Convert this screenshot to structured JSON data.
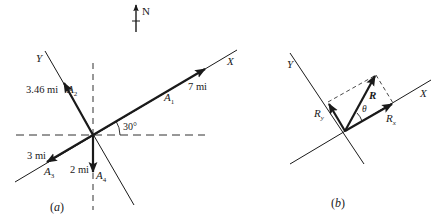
{
  "north": {
    "label": "N"
  },
  "figure_a": {
    "caption": "(a)",
    "axes": {
      "x_label": "X",
      "y_label": "Y"
    },
    "angle_label": "30°",
    "vectors": [
      {
        "name": "A",
        "sub": "1",
        "magnitude": "7 mi"
      },
      {
        "name": "A",
        "sub": "2",
        "magnitude": "3.46 mi"
      },
      {
        "name": "A",
        "sub": "3",
        "magnitude": "3 mi"
      },
      {
        "name": "A",
        "sub": "4",
        "magnitude": "2 mi"
      }
    ]
  },
  "figure_b": {
    "caption": "(b)",
    "axes": {
      "x_label": "X",
      "y_label": "Y"
    },
    "resultant": "R",
    "component_x": {
      "name": "R",
      "sub": "x"
    },
    "component_y": {
      "name": "R",
      "sub": "y"
    },
    "angle_label": "θ"
  },
  "colors": {
    "ink": "#1a1a1a",
    "background": "#ffffff"
  }
}
